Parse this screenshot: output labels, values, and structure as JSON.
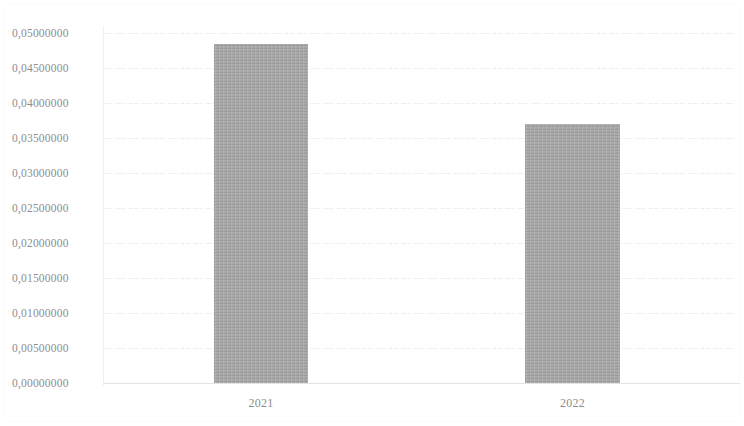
{
  "chart_data": {
    "type": "bar",
    "title": "",
    "subtitle": "",
    "xlabel": "",
    "ylabel": "",
    "categories": [
      "2021",
      "2022"
    ],
    "values": [
      0.04843,
      0.037
    ],
    "series": [
      {
        "name": "",
        "values": [
          0.04843,
          0.037
        ]
      }
    ],
    "ylim": [
      0.0,
      0.05
    ],
    "y_tick_step": 0.005,
    "y_tick_labels": [
      "0,05000000",
      "0,04500000",
      "0,04000000",
      "0,03500000",
      "0,03000000",
      "0,02500000",
      "0,02000000",
      "0,01500000",
      "0,01000000",
      "0,00500000",
      "0,00000000"
    ],
    "y_tick_values": [
      0.05,
      0.045,
      0.04,
      0.035,
      0.03,
      0.025,
      0.02,
      0.015,
      0.01,
      0.005,
      0.0
    ],
    "x_tick_labels": [
      "2021",
      "2022"
    ],
    "grid": "horizontal",
    "legend": "none",
    "decimal_separator": ",",
    "colors": {
      "bar": "#a6a6a6",
      "gridline": "#ededed",
      "axis": "#e3e3e3",
      "text": "#8d8d8d",
      "background": "#ffffff"
    }
  }
}
